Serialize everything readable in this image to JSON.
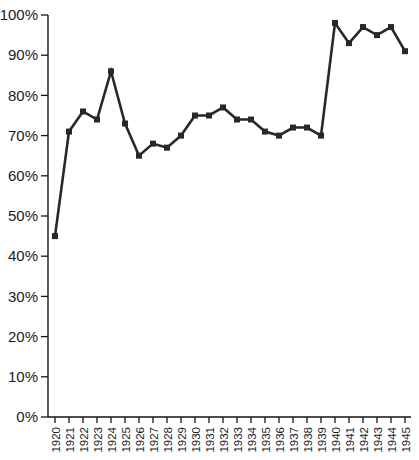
{
  "figure": {
    "background": "#ffffff"
  },
  "chart_data": {
    "type": "line",
    "title": "",
    "xlabel": "",
    "ylabel": "",
    "categories": [
      "1920",
      "1921",
      "1922",
      "1923",
      "1924",
      "1925",
      "1926",
      "1927",
      "1928",
      "1929",
      "1930",
      "1931",
      "1932",
      "1933",
      "1934",
      "1935",
      "1936",
      "1937",
      "1938",
      "1939",
      "1940",
      "1941",
      "1942",
      "1943",
      "1944",
      "1945"
    ],
    "values": [
      45,
      71,
      76,
      74,
      86,
      73,
      65,
      68,
      67,
      70,
      75,
      75,
      77,
      74,
      74,
      71,
      70,
      72,
      72,
      70,
      98,
      93,
      97,
      95,
      97,
      91
    ],
    "ylim": [
      0,
      100
    ],
    "y_ticks": [
      0,
      10,
      20,
      30,
      40,
      50,
      60,
      70,
      80,
      90,
      100
    ],
    "y_tick_labels": [
      "0%",
      "10%",
      "20%",
      "30%",
      "40%",
      "50%",
      "60%",
      "70%",
      "80%",
      "90%",
      "100%"
    ],
    "grid": false,
    "legend": "none",
    "marker": "square",
    "line_color": "#282828",
    "axis_color": "#151515",
    "text_color": "#1c1c1c"
  }
}
